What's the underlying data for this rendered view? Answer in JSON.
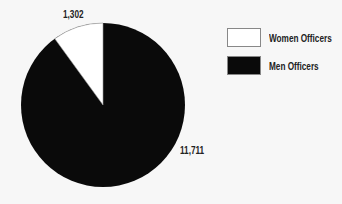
{
  "chart_data": {
    "type": "pie",
    "title": "",
    "categories": [
      "Women Officers",
      "Men Officers"
    ],
    "values": [
      1302,
      11711
    ],
    "value_labels": [
      "1,302",
      "11,711"
    ],
    "colors": [
      "#ffffff",
      "#0a0a0a"
    ],
    "legend_position": "right"
  },
  "legend": {
    "items": [
      {
        "label": "Women Officers",
        "color": "#ffffff"
      },
      {
        "label": "Men Officers",
        "color": "#0a0a0a"
      }
    ]
  },
  "labels": {
    "women": "1,302",
    "men": "11,711"
  }
}
